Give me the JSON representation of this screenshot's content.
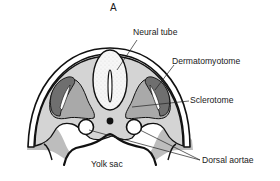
{
  "figure": {
    "panel_label": "A"
  },
  "labels": {
    "neural_tube": "Neural tube",
    "dermatomyotome": "Dermatomyotome",
    "sclerotome": "Sclerotome",
    "dorsal_aortae": "Dorsal aortae",
    "yolk_sac": "Yolk sac"
  },
  "colors": {
    "outline": "#111111",
    "mesenchyme_light": "#d4d4d4",
    "sclerotome_mid": "#a9a9a9",
    "dermatomyotome_dark": "#6f6f6f",
    "neural_tube_fill": "#f4f4f4",
    "ectoderm": "#ffffff",
    "background": "#ffffff"
  }
}
